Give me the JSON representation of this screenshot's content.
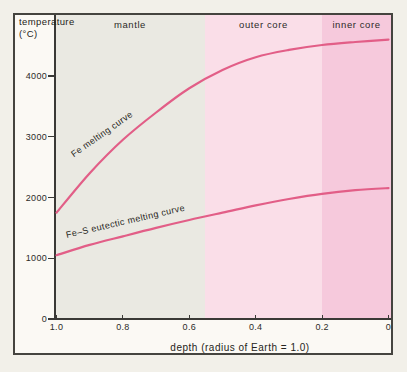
{
  "axes": {
    "y_title_line1": "temperature",
    "y_title_line2": "(°C)",
    "x_title": "depth (radius of Earth = 1.0)"
  },
  "chart_data": {
    "type": "line",
    "title": "",
    "xlabel": "depth (radius of Earth = 1.0)",
    "ylabel": "temperature (°C)",
    "xlim": [
      1.0,
      0.0
    ],
    "ylim": [
      0,
      5000
    ],
    "grid": false,
    "legend_position": "labels-along-curves",
    "x": [
      1.0,
      0.9,
      0.8,
      0.7,
      0.6,
      0.5,
      0.4,
      0.3,
      0.2,
      0.1,
      0.0
    ],
    "series": [
      {
        "name": "Fe melting curve",
        "values": [
          1750,
          2400,
          2950,
          3400,
          3800,
          4100,
          4310,
          4430,
          4510,
          4560,
          4600
        ]
      },
      {
        "name": "Fe–S eutectic melting curve",
        "values": [
          1050,
          1220,
          1360,
          1500,
          1630,
          1750,
          1870,
          1975,
          2060,
          2120,
          2155
        ]
      }
    ],
    "x_ticks": {
      "values": [
        1.0,
        0.8,
        0.6,
        0.4,
        0.2,
        0.0
      ],
      "labels": [
        "1.0",
        "0.8",
        "0.6",
        "0.4",
        "0.2",
        "0"
      ]
    },
    "y_ticks": {
      "values": [
        0,
        1000,
        2000,
        3000,
        4000
      ],
      "labels": [
        "0",
        "1000",
        "2000",
        "3000",
        "4000"
      ]
    },
    "regions": [
      {
        "label": "mantle",
        "from_depth": 1.0,
        "to_depth": 0.553,
        "color": "#eae9e2"
      },
      {
        "label": "outer core",
        "from_depth": 0.553,
        "to_depth": 0.2,
        "color": "#fadee8"
      },
      {
        "label": "inner core",
        "from_depth": 0.2,
        "to_depth": 0.0,
        "color": "#f6c9dc"
      }
    ],
    "line_color": "#e25e87"
  }
}
